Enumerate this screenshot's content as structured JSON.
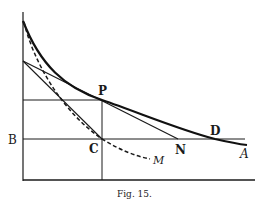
{
  "figure": {
    "caption": "Fig. 15.",
    "colors": {
      "ink": "#1a1a1a",
      "background": "#ffffff"
    },
    "labels": {
      "P": "P",
      "B": "B",
      "C": "C",
      "N": "N",
      "D": "D",
      "A": "A",
      "M": "M"
    },
    "elements": [
      {
        "name": "vertical-axis",
        "style": "solid"
      },
      {
        "name": "horizontal-axis",
        "style": "solid"
      },
      {
        "name": "curve-A",
        "style": "heavy solid",
        "passes_through": [
          "P",
          "D"
        ],
        "ends_at": "A"
      },
      {
        "name": "curve-M",
        "style": "dashed",
        "passes_through": [
          "C"
        ],
        "ends_at": "M"
      },
      {
        "name": "line-BD",
        "style": "solid horizontal"
      },
      {
        "name": "tangent-at-P",
        "style": "solid",
        "ends_at": "N"
      },
      {
        "name": "line-to-C",
        "style": "solid"
      },
      {
        "name": "horizontal-through-P",
        "style": "solid"
      },
      {
        "name": "vertical-through-P-C",
        "style": "solid"
      }
    ]
  }
}
